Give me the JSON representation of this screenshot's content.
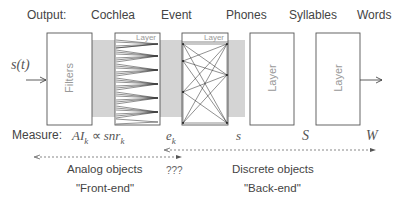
{
  "headers": {
    "output": "Output:",
    "cochlea": "Cochlea",
    "event": "Event",
    "phones": "Phones",
    "syllables": "Syllables",
    "words": "Words"
  },
  "input_signal": "s(t)",
  "blocks": {
    "filters": "Filters",
    "cochlea_layer": "Layer",
    "event_layer": "Layer",
    "phones_layer": "Layer",
    "syllables_layer": "Layer"
  },
  "measure": {
    "label": "Measure:",
    "cochlea": "AI",
    "cochlea_sub": "k",
    "propto": "∝",
    "snr": "snr",
    "snr_sub": "k",
    "event": "e",
    "event_sub": "k",
    "phones": "s",
    "syllables": "S",
    "words": "W"
  },
  "ranges": {
    "analog_title": "Analog objects",
    "analog_subtitle": "\"Front-end\"",
    "unknown": "???",
    "discrete_title": "Discrete objects",
    "discrete_subtitle": "\"Back-end\""
  },
  "colors": {
    "band": "#d4d4d4",
    "box_border": "#555555",
    "line": "#222222"
  }
}
